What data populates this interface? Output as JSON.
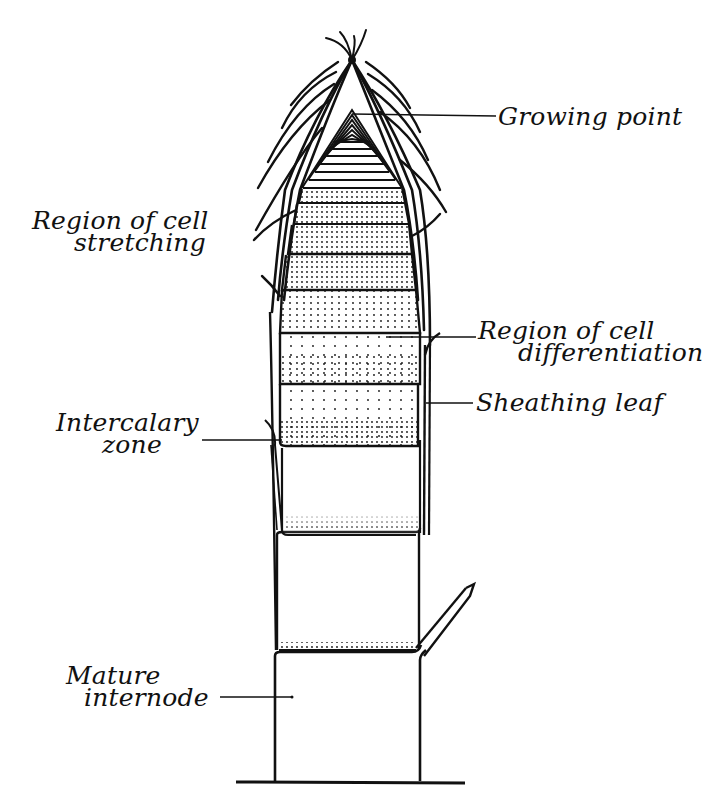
{
  "diagram": {
    "colors": {
      "ink": "#111111",
      "background": "#ffffff"
    },
    "labels": {
      "growing_point": {
        "text": "Growing point"
      },
      "cell_stretching": {
        "line1": "Region of cell",
        "line2": "stretching"
      },
      "cell_differentiation": {
        "line1": "Region of cell",
        "line2": "differentiation"
      },
      "sheathing_leaf": {
        "text": "Sheathing leaf"
      },
      "intercalary_zone": {
        "line1": "Intercalary",
        "line2": "zone"
      },
      "mature_internode": {
        "line1": "Mature",
        "line2": "internode"
      }
    }
  }
}
